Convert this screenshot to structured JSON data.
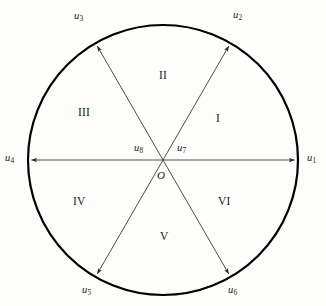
{
  "figure": {
    "type": "geometry-diagram",
    "background_color": "#fdfdfc",
    "stroke_color": "#000000",
    "line_color": "#3a3a3a",
    "circle": {
      "center_x": 163,
      "center_y": 160,
      "radius": 135,
      "stroke_width": 2.2
    },
    "vectors": [
      {
        "id": "u1",
        "base": "u",
        "sub": "1",
        "angle_deg": 0,
        "label_x": 307,
        "label_y": 153,
        "arrow": true,
        "length_frac": 1.0
      },
      {
        "id": "u2",
        "base": "u",
        "sub": "2",
        "angle_deg": 60,
        "label_x": 233,
        "label_y": 10,
        "arrow": true,
        "length_frac": 1.0
      },
      {
        "id": "u3",
        "base": "u",
        "sub": "3",
        "angle_deg": 120,
        "label_x": 74,
        "label_y": 11,
        "arrow": true,
        "length_frac": 1.0
      },
      {
        "id": "u4",
        "base": "u",
        "sub": "4",
        "angle_deg": 180,
        "label_x": 5,
        "label_y": 153,
        "arrow": true,
        "length_frac": 1.0
      },
      {
        "id": "u5",
        "base": "u",
        "sub": "5",
        "angle_deg": 240,
        "label_x": 82,
        "label_y": 285,
        "arrow": true,
        "length_frac": 1.0
      },
      {
        "id": "u6",
        "base": "u",
        "sub": "6",
        "angle_deg": 300,
        "label_x": 228,
        "label_y": 285,
        "arrow": true,
        "length_frac": 1.0
      },
      {
        "id": "u7",
        "base": "u",
        "sub": "7",
        "angle_deg": 0,
        "label_x": 177,
        "label_y": 143,
        "arrow": false,
        "length_frac": 0.0
      },
      {
        "id": "u8",
        "base": "u",
        "sub": "8",
        "angle_deg": 180,
        "label_x": 134,
        "label_y": 143,
        "arrow": false,
        "length_frac": 0.0
      }
    ],
    "origin": {
      "label": "O",
      "x": 157,
      "y": 170
    },
    "regions": [
      {
        "id": "I",
        "label": "I",
        "x": 216,
        "y": 113
      },
      {
        "id": "II",
        "label": "II",
        "x": 159,
        "y": 70
      },
      {
        "id": "III",
        "label": "III",
        "x": 78,
        "y": 107
      },
      {
        "id": "IV",
        "label": "IV",
        "x": 73,
        "y": 196
      },
      {
        "id": "V",
        "label": "V",
        "x": 160,
        "y": 231
      },
      {
        "id": "VI",
        "label": "VI",
        "x": 218,
        "y": 196
      }
    ]
  }
}
